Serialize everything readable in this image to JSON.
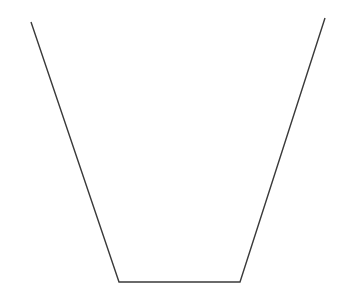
{
  "diagram": {
    "shape": "open-trapezoid",
    "stroke_color": "#3a3a3a",
    "background_color": "#ffffff",
    "stroke_width": 1.4,
    "points": [
      {
        "x": 31,
        "y": 22
      },
      {
        "x": 119,
        "y": 282
      },
      {
        "x": 240,
        "y": 282
      },
      {
        "x": 325,
        "y": 18
      }
    ],
    "segments": [
      {
        "name": "left-side",
        "from": [
          31,
          22
        ],
        "to": [
          119,
          282
        ]
      },
      {
        "name": "bottom-base",
        "from": [
          119,
          282
        ],
        "to": [
          240,
          282
        ]
      },
      {
        "name": "right-side",
        "from": [
          240,
          282
        ],
        "to": [
          325,
          18
        ]
      }
    ]
  }
}
